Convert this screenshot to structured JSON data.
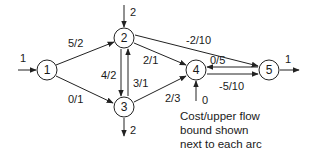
{
  "diagram": {
    "type": "network-flow",
    "nodes": [
      {
        "id": "1",
        "label": "1",
        "x": 47,
        "y": 70
      },
      {
        "id": "2",
        "label": "2",
        "x": 124,
        "y": 38
      },
      {
        "id": "3",
        "label": "3",
        "x": 124,
        "y": 107
      },
      {
        "id": "4",
        "label": "4",
        "x": 196,
        "y": 70
      },
      {
        "id": "5",
        "label": "5",
        "x": 269,
        "y": 70
      }
    ],
    "arcs": [
      {
        "from": "1",
        "to": "2",
        "label": "5/2"
      },
      {
        "from": "1",
        "to": "3",
        "label": "0/1"
      },
      {
        "from": "2",
        "to": "3",
        "label": "4/2"
      },
      {
        "from": "3",
        "to": "2",
        "label": "3/1"
      },
      {
        "from": "2",
        "to": "4",
        "label": "2/1"
      },
      {
        "from": "2",
        "to": "5",
        "label": "-2/10"
      },
      {
        "from": "3",
        "to": "4",
        "label": "2/3"
      },
      {
        "from": "5",
        "to": "4",
        "label": "0/5"
      },
      {
        "from": "4",
        "to": "5",
        "label": "-5/10"
      }
    ],
    "external_flows": [
      {
        "node": "1",
        "direction": "in",
        "label": "1"
      },
      {
        "node": "2",
        "direction": "in",
        "label": "2"
      },
      {
        "node": "3",
        "direction": "out",
        "label": "2"
      },
      {
        "node": "4",
        "direction": "in",
        "label": "0"
      },
      {
        "node": "5",
        "direction": "out",
        "label": "1"
      }
    ],
    "caption": [
      "Cost/upper flow",
      "bound shown",
      "next to each arc"
    ]
  }
}
